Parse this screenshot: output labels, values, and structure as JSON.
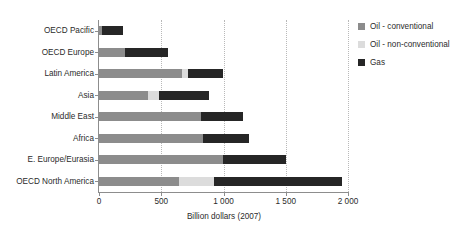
{
  "chart_data": {
    "type": "bar",
    "orientation": "horizontal",
    "stacked": true,
    "title": "",
    "xlabel": "Billion dollars (2007)",
    "ylabel": "",
    "xlim": [
      0,
      2000
    ],
    "xticks": [
      0,
      500,
      1000,
      1500,
      2000
    ],
    "xtick_labels": [
      "0",
      "500",
      "1 000",
      "1 500",
      "2 000"
    ],
    "grid": "vertical-dotted",
    "legend_position": "right",
    "categories": [
      "OECD Pacific",
      "OECD Europe",
      "Latin America",
      "Asia",
      "Middle East",
      "Africa",
      "E. Europe/Eurasia",
      "OECD North America"
    ],
    "series": [
      {
        "name": "Oil - conventional",
        "color": "#8c8c8c",
        "values": [
          25,
          210,
          665,
          395,
          820,
          835,
          995,
          645
        ]
      },
      {
        "name": "Oil - non-conventional",
        "color": "#dcdcdc",
        "values": [
          0,
          0,
          50,
          90,
          0,
          0,
          0,
          275
        ]
      },
      {
        "name": "Gas",
        "color": "#262626",
        "values": [
          170,
          345,
          280,
          395,
          340,
          370,
          505,
          1030
        ]
      }
    ],
    "totals": [
      195,
      555,
      995,
      880,
      1160,
      1205,
      1500,
      1950
    ]
  },
  "legend": {
    "items": [
      {
        "label": "Oil - conventional",
        "color": "#8c8c8c"
      },
      {
        "label": "Oil - non-conventional",
        "color": "#dcdcdc"
      },
      {
        "label": "Gas",
        "color": "#262626"
      }
    ]
  }
}
